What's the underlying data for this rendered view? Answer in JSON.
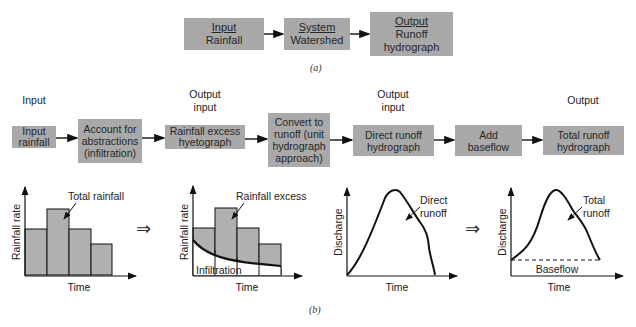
{
  "part_a": {
    "caption": "(a)",
    "boxes": [
      {
        "heading": "Input",
        "text": "Rainfall"
      },
      {
        "heading": "System",
        "text": "Watershed"
      },
      {
        "heading": "Output",
        "text": "Runoff hydrograph",
        "line1": "Runoff",
        "line2": "hydrograph"
      }
    ]
  },
  "part_b": {
    "caption": "(b)",
    "stage_labels": [
      {
        "line1": "Input",
        "line2": ""
      },
      {
        "line1": "Output",
        "line2": "input"
      },
      {
        "line1": "Output",
        "line2": "input"
      },
      {
        "line1": "Output",
        "line2": ""
      }
    ],
    "boxes": [
      {
        "lines": [
          "Input",
          "rainfall"
        ]
      },
      {
        "lines": [
          "Account for",
          "abstractions",
          "(infiltration)"
        ]
      },
      {
        "lines": [
          "Rainfall excess",
          "hyetograph"
        ]
      },
      {
        "lines": [
          "Convert to",
          "runoff (unit",
          "hydrograph",
          "approach)"
        ]
      },
      {
        "lines": [
          "Direct runoff",
          "hydrograph"
        ]
      },
      {
        "lines": [
          "Add",
          "baseflow"
        ]
      },
      {
        "lines": [
          "Total runoff",
          "hydrograph"
        ]
      }
    ],
    "implies_symbol": "⇒",
    "charts": [
      {
        "ylabel": "Rainfall rate",
        "xlabel": "Time",
        "annotation": "Total rainfall"
      },
      {
        "ylabel": "Rainfall rate",
        "xlabel": "Time",
        "annotation": "Rainfall excess",
        "annotation2": "Infiltration"
      },
      {
        "ylabel": "Discharge",
        "xlabel": "Time",
        "annotation_line1": "Direct",
        "annotation_line2": "runoff"
      },
      {
        "ylabel": "Discharge",
        "xlabel": "Time",
        "annotation_line1": "Total",
        "annotation_line2": "runoff",
        "annotation2": "Baseflow"
      }
    ]
  },
  "colors": {
    "box_fill": "#a9a9a9",
    "bar_fill": "#b0b0b0",
    "line": "#111111"
  }
}
